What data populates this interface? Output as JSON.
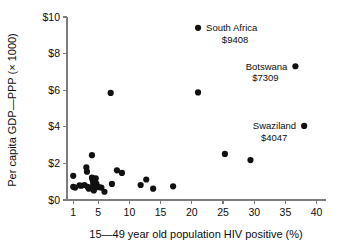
{
  "chart_data": {
    "type": "scatter",
    "title": "",
    "xlabel": "15—49 year old population HIV positive (%)",
    "ylabel": "Per capita GDP—PPP (× 1000)",
    "xlim": [
      0,
      41.5
    ],
    "ylim": [
      0,
      10
    ],
    "grid": false,
    "legend": "none",
    "xticks": [
      1,
      5,
      10,
      15,
      20,
      25,
      30,
      35,
      40
    ],
    "xtick_labels": [
      "1",
      "5",
      "10",
      "15",
      "20",
      "25",
      "30",
      "35",
      "40"
    ],
    "yticks": [
      0,
      2,
      4,
      6,
      8,
      10
    ],
    "ytick_labels": [
      "$0",
      "$2",
      "$4",
      "$6",
      "$8",
      "$10"
    ],
    "marker_color": "#111111",
    "axis_color": "#7c7c7c",
    "points": [
      {
        "x": 1.0,
        "y": 1.32
      },
      {
        "x": 1.0,
        "y": 0.72
      },
      {
        "x": 1.3,
        "y": 0.68
      },
      {
        "x": 2.0,
        "y": 0.8
      },
      {
        "x": 2.3,
        "y": 0.78
      },
      {
        "x": 2.8,
        "y": 0.82
      },
      {
        "x": 3.1,
        "y": 1.78
      },
      {
        "x": 3.2,
        "y": 1.55
      },
      {
        "x": 3.3,
        "y": 0.72
      },
      {
        "x": 3.5,
        "y": 0.62
      },
      {
        "x": 4.0,
        "y": 2.45
      },
      {
        "x": 4.0,
        "y": 1.22
      },
      {
        "x": 4.1,
        "y": 1.1
      },
      {
        "x": 4.2,
        "y": 0.95
      },
      {
        "x": 4.2,
        "y": 0.8
      },
      {
        "x": 4.3,
        "y": 0.68
      },
      {
        "x": 4.3,
        "y": 0.52
      },
      {
        "x": 4.6,
        "y": 1.18
      },
      {
        "x": 4.7,
        "y": 0.9
      },
      {
        "x": 4.8,
        "y": 0.72
      },
      {
        "x": 5.1,
        "y": 0.7
      },
      {
        "x": 5.5,
        "y": 0.68
      },
      {
        "x": 6.0,
        "y": 0.45
      },
      {
        "x": 7.0,
        "y": 5.85
      },
      {
        "x": 7.2,
        "y": 0.88
      },
      {
        "x": 8.0,
        "y": 1.62
      },
      {
        "x": 8.8,
        "y": 1.48
      },
      {
        "x": 11.8,
        "y": 0.82
      },
      {
        "x": 12.7,
        "y": 1.12
      },
      {
        "x": 13.8,
        "y": 0.62
      },
      {
        "x": 17.0,
        "y": 0.75
      },
      {
        "x": 21.0,
        "y": 5.88
      },
      {
        "x": 25.3,
        "y": 2.52
      },
      {
        "x": 29.4,
        "y": 2.18
      },
      {
        "x": 21.0,
        "y": 9.408,
        "label": "South Africa",
        "value_label": "$9408"
      },
      {
        "x": 36.6,
        "y": 7.309,
        "label": "Botswana",
        "value_label": "$7309"
      },
      {
        "x": 38.0,
        "y": 4.047,
        "label": "Swaziland",
        "value_label": "$4047"
      }
    ],
    "annotations": [
      {
        "name": "South Africa",
        "value": "$9408",
        "x": 21.0,
        "y": 9.408,
        "side": "right"
      },
      {
        "name": "Botswana",
        "value": "$7309",
        "x": 36.6,
        "y": 7.309,
        "side": "left"
      },
      {
        "name": "Swaziland",
        "value": "$4047",
        "x": 38.0,
        "y": 4.047,
        "side": "left"
      }
    ]
  }
}
